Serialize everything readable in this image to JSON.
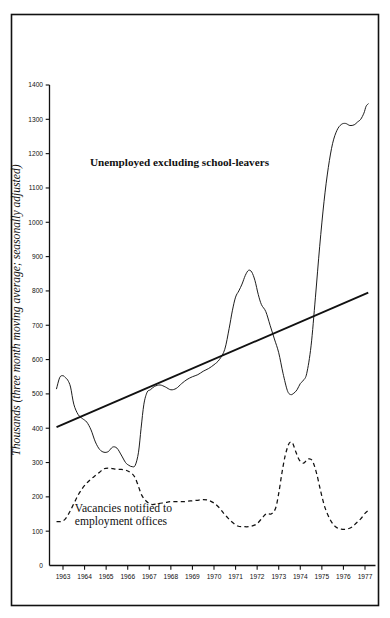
{
  "figure": {
    "background_color": "#ffffff",
    "ink_color": "#111111",
    "frame": {
      "x": 11,
      "y": 14,
      "width": 368,
      "height": 592
    }
  },
  "chart_data": {
    "type": "line",
    "title": "",
    "xlabel": "",
    "ylabel": "Thousands (three month moving average; seasonally adjusted)",
    "xlim": [
      1962.6,
      1977.3
    ],
    "ylim": [
      0,
      1450
    ],
    "grid": false,
    "legend": "inline-annotations",
    "y_ticks": [
      0,
      100,
      200,
      300,
      400,
      500,
      600,
      700,
      800,
      900,
      1000,
      1100,
      1200,
      1300,
      1400
    ],
    "x_ticks": [
      1963,
      1964,
      1965,
      1966,
      1967,
      1968,
      1969,
      1970,
      1971,
      1972,
      1973,
      1974,
      1975,
      1976,
      1977
    ],
    "x_tick_labels": [
      "1963",
      "1964",
      "1965",
      "1966",
      "1967",
      "1968",
      "1969",
      "1970",
      "1971",
      "1972",
      "1973",
      "1974",
      "1975",
      "1976",
      "1977"
    ],
    "annotations": [
      {
        "name": "unemployed-series-label",
        "text": "Unemployed excluding school-leavers",
        "x": 1968.4,
        "y": 1165,
        "style": "bold"
      },
      {
        "name": "vacancies-series-label",
        "line1": "Vacancies notified to",
        "line2": "employment offices",
        "x": 1963.55,
        "y": 155,
        "style": "regular"
      }
    ],
    "series": [
      {
        "name": "Unemployed excluding school-leavers",
        "style": "solid",
        "x": [
          1962.7,
          1962.85,
          1963.0,
          1963.1,
          1963.22,
          1963.35,
          1963.5,
          1963.7,
          1963.9,
          1964.1,
          1964.3,
          1964.5,
          1964.7,
          1964.9,
          1965.1,
          1965.3,
          1965.5,
          1965.7,
          1965.9,
          1966.05,
          1966.2,
          1966.35,
          1966.5,
          1966.62,
          1966.75,
          1966.9,
          1967.05,
          1967.25,
          1967.5,
          1967.75,
          1968.0,
          1968.25,
          1968.5,
          1968.75,
          1969.0,
          1969.25,
          1969.5,
          1969.75,
          1970.0,
          1970.25,
          1970.5,
          1970.7,
          1970.85,
          1971.0,
          1971.15,
          1971.3,
          1971.45,
          1971.6,
          1971.75,
          1971.9,
          1972.05,
          1972.2,
          1972.4,
          1972.6,
          1972.8,
          1973.0,
          1973.2,
          1973.4,
          1973.55,
          1973.7,
          1973.85,
          1974.0,
          1974.15,
          1974.3,
          1974.5,
          1974.7,
          1974.9,
          1975.1,
          1975.3,
          1975.5,
          1975.7,
          1975.9,
          1976.1,
          1976.3,
          1976.5,
          1976.65,
          1976.8,
          1976.95,
          1977.05,
          1977.15
        ],
        "y": [
          515,
          548,
          553,
          548,
          540,
          520,
          470,
          440,
          428,
          418,
          395,
          360,
          338,
          330,
          332,
          345,
          342,
          322,
          300,
          292,
          288,
          292,
          330,
          400,
          470,
          505,
          512,
          522,
          526,
          520,
          512,
          516,
          530,
          542,
          550,
          556,
          566,
          574,
          585,
          600,
          630,
          690,
          742,
          782,
          800,
          820,
          845,
          860,
          855,
          830,
          790,
          760,
          740,
          700,
          660,
          620,
          560,
          510,
          498,
          502,
          512,
          530,
          540,
          560,
          640,
          780,
          930,
          1060,
          1160,
          1230,
          1268,
          1285,
          1288,
          1282,
          1284,
          1292,
          1300,
          1318,
          1338,
          1345
        ]
      },
      {
        "name": "Vacancies notified to employment offices",
        "style": "dashed",
        "x": [
          1962.7,
          1962.9,
          1963.1,
          1963.3,
          1963.5,
          1963.7,
          1963.9,
          1964.1,
          1964.3,
          1964.5,
          1964.7,
          1964.9,
          1965.1,
          1965.3,
          1965.5,
          1965.7,
          1965.9,
          1966.05,
          1966.2,
          1966.35,
          1966.5,
          1966.65,
          1966.85,
          1967.1,
          1967.4,
          1967.7,
          1968.0,
          1968.3,
          1968.6,
          1968.9,
          1969.2,
          1969.5,
          1969.75,
          1970.0,
          1970.25,
          1970.45,
          1970.65,
          1970.85,
          1971.1,
          1971.4,
          1971.7,
          1972.0,
          1972.25,
          1972.45,
          1972.65,
          1972.85,
          1973.0,
          1973.15,
          1973.3,
          1973.45,
          1973.55,
          1973.65,
          1973.8,
          1973.95,
          1974.15,
          1974.35,
          1974.55,
          1974.75,
          1974.95,
          1975.15,
          1975.4,
          1975.65,
          1975.9,
          1976.15,
          1976.4,
          1976.6,
          1976.8,
          1977.0,
          1977.15
        ],
        "y": [
          128,
          128,
          135,
          155,
          180,
          205,
          225,
          240,
          252,
          262,
          272,
          282,
          284,
          282,
          280,
          280,
          278,
          274,
          268,
          255,
          230,
          205,
          188,
          178,
          180,
          183,
          186,
          186,
          186,
          188,
          190,
          192,
          190,
          182,
          168,
          152,
          138,
          126,
          115,
          113,
          114,
          122,
          140,
          152,
          150,
          166,
          210,
          270,
          320,
          352,
          360,
          356,
          330,
          308,
          298,
          310,
          306,
          270,
          215,
          168,
          132,
          112,
          106,
          106,
          112,
          124,
          136,
          152,
          160
        ]
      },
      {
        "name": "Trend line",
        "style": "solid-thick",
        "x": [
          1962.7,
          1977.15
        ],
        "y": [
          403,
          795
        ]
      }
    ]
  }
}
